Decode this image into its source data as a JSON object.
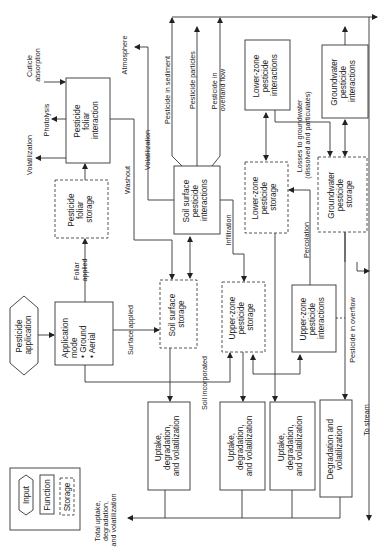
{
  "diagram": {
    "orientation": "rotated 90 degrees counter-clockwise",
    "nodes": {
      "pesticide_application": {
        "type": "input",
        "lines": [
          "Pesticide",
          "application"
        ]
      },
      "application_mode": {
        "type": "function",
        "lines": [
          "Application",
          "mode",
          "• Ground",
          "• Aerial"
        ]
      },
      "foliar_storage": {
        "type": "storage",
        "lines": [
          "Pesticide",
          "foliar",
          "storage"
        ]
      },
      "foliar_interaction": {
        "type": "function",
        "lines": [
          "Pesticide",
          "foliar",
          "interaction"
        ]
      },
      "soil_surface_storage": {
        "type": "storage",
        "lines": [
          "Soil surface",
          "storage"
        ]
      },
      "soil_surface_interactions": {
        "type": "function",
        "lines": [
          "Soil surface",
          "pesticide",
          "interactions"
        ]
      },
      "upper_zone_storage": {
        "type": "storage",
        "lines": [
          "Upper-zone",
          "pesticide",
          "storage"
        ]
      },
      "upper_zone_interactions": {
        "type": "function",
        "lines": [
          "Upper-zone",
          "pesticide",
          "interactions"
        ]
      },
      "lower_zone_storage": {
        "type": "storage",
        "lines": [
          "Lower-zone",
          "pesticide",
          "storage"
        ]
      },
      "lower_zone_interactions": {
        "type": "function",
        "lines": [
          "Lower-zone",
          "pesticide",
          "interactions"
        ]
      },
      "groundwater_storage": {
        "type": "storage",
        "lines": [
          "Groundwater",
          "pesticide",
          "storage"
        ]
      },
      "groundwater_interactions": {
        "type": "function",
        "lines": [
          "Groundwater",
          "pesticide",
          "interactions"
        ]
      },
      "uptake_1": {
        "type": "function",
        "lines": [
          "Uptake,",
          "degradation,",
          "and volatilization"
        ]
      },
      "uptake_2": {
        "type": "function",
        "lines": [
          "Uptake,",
          "degradation,",
          "and volatilization"
        ]
      },
      "uptake_3": {
        "type": "function",
        "lines": [
          "Uptake,",
          "degradation,",
          "and volatilization"
        ]
      },
      "degradation": {
        "type": "function",
        "lines": [
          "Degradation and",
          "volatilization"
        ]
      }
    },
    "edge_labels": {
      "cuticle": [
        "Cuticle",
        "absorption"
      ],
      "photolysis": "Photolysis",
      "volatilization_foliar": "Volatilization",
      "atmosphere": "Atmosphere",
      "washout": "Washout",
      "volatilization_soil": "Volatilization",
      "foliar_applied": [
        "Foliar",
        "applied"
      ],
      "surface_applied": "Surface applied",
      "soil_incorporated": "Soil incorporated",
      "infiltration": "Infiltration",
      "percolation": "Percolation",
      "pesticide_sediment": "Pesticide in sediment",
      "pesticide_particles": "Pesticide particles",
      "pesticide_overland": [
        "Pesticide in",
        "overland flow"
      ],
      "losses_groundwater": [
        "Losses to groundwater",
        "(dissolved and particulates)"
      ],
      "pesticide_overflow": "Pesticide in overflow",
      "to_stream": "To stream",
      "total_uptake": [
        "Total uptake,",
        "degradation,",
        "and volatilization"
      ]
    },
    "legend": {
      "input": "Input",
      "function": "Function",
      "storage": "Storage"
    }
  }
}
